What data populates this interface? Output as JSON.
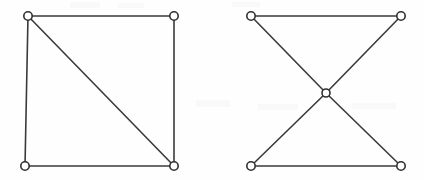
{
  "figure": {
    "background_color": "#fefefe",
    "edge_color": "#3a3a3a",
    "vertex_fill_color": "#ffffff",
    "vertex_stroke_color": "#2f2f2f",
    "edge_stroke_width": 1.6,
    "vertex_radius": 4.2,
    "width": 424,
    "height": 180
  },
  "chart_data": {
    "type": "diagram",
    "subtype": "node-link-graph",
    "xlabel": "",
    "ylabel": "",
    "grid": false,
    "legend": "none",
    "annotations": [],
    "tick_labels": [],
    "graphs": [
      {
        "name": "left-graph",
        "description": "Square with one diagonal (K4 minus an edge, diamond graph)",
        "vertex_count": 4,
        "edge_count": 5,
        "nodes": [
          {
            "id": "L-TL",
            "label": "",
            "x": 28,
            "y": 16,
            "degree": 3
          },
          {
            "id": "L-TR",
            "label": "",
            "x": 174,
            "y": 16,
            "degree": 2
          },
          {
            "id": "L-BL",
            "label": "",
            "x": 25,
            "y": 166,
            "degree": 2
          },
          {
            "id": "L-BR",
            "label": "",
            "x": 174,
            "y": 166,
            "degree": 3
          }
        ],
        "edges": [
          {
            "from": "L-TL",
            "to": "L-TR",
            "kind": "top-horizontal"
          },
          {
            "from": "L-TL",
            "to": "L-BL",
            "kind": "left-vertical"
          },
          {
            "from": "L-TR",
            "to": "L-BR",
            "kind": "right-vertical"
          },
          {
            "from": "L-BL",
            "to": "L-BR",
            "kind": "bottom-horizontal"
          },
          {
            "from": "L-TL",
            "to": "L-BR",
            "kind": "diagonal"
          }
        ]
      },
      {
        "name": "right-graph",
        "description": "Bowtie / butterfly graph: four outer corners joined through a central hub, plus top and bottom horizontals",
        "vertex_count": 5,
        "edge_count": 6,
        "nodes": [
          {
            "id": "R-TL",
            "label": "",
            "x": 251,
            "y": 16,
            "degree": 2
          },
          {
            "id": "R-TR",
            "label": "",
            "x": 401,
            "y": 16,
            "degree": 2
          },
          {
            "id": "R-CENTER",
            "label": "",
            "x": 326,
            "y": 93,
            "degree": 4
          },
          {
            "id": "R-BL",
            "label": "",
            "x": 251,
            "y": 166,
            "degree": 2
          },
          {
            "id": "R-BR",
            "label": "",
            "x": 401,
            "y": 166,
            "degree": 2
          }
        ],
        "edges": [
          {
            "from": "R-TL",
            "to": "R-TR",
            "kind": "top-horizontal"
          },
          {
            "from": "R-BL",
            "to": "R-BR",
            "kind": "bottom-horizontal"
          },
          {
            "from": "R-TL",
            "to": "R-CENTER",
            "kind": "spoke"
          },
          {
            "from": "R-TR",
            "to": "R-CENTER",
            "kind": "spoke"
          },
          {
            "from": "R-BL",
            "to": "R-CENTER",
            "kind": "spoke"
          },
          {
            "from": "R-BR",
            "to": "R-CENTER",
            "kind": "spoke"
          }
        ]
      }
    ]
  }
}
